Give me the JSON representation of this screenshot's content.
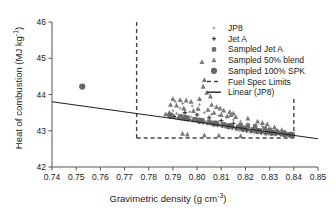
{
  "chart_data": {
    "type": "scatter",
    "title": "",
    "xlabel": "Gravimetric density (g cm",
    "xlabel_sup": "-3",
    "xlabel_tail": ")",
    "ylabel": "Heat of combustion (MJ kg",
    "ylabel_sup": "-1",
    "ylabel_tail": ")",
    "xlim": [
      0.74,
      0.85
    ],
    "ylim": [
      42,
      46
    ],
    "xticks": [
      "0.74",
      "0.75",
      "0.76",
      "0.77",
      "0.78",
      "0.79",
      "0.80",
      "0.81",
      "0.82",
      "0.83",
      "0.84",
      "0.85"
    ],
    "xtick_values": [
      0.74,
      0.75,
      0.76,
      0.77,
      0.78,
      0.79,
      0.8,
      0.81,
      0.82,
      0.83,
      0.84,
      0.85
    ],
    "yticks": [
      "42",
      "43",
      "44",
      "45",
      "46"
    ],
    "ytick_values": [
      42,
      43,
      44,
      45,
      46
    ],
    "grid": false,
    "legend_position": "top-right",
    "colors": {
      "jp8": "#8c8c8c",
      "jet_a": "#3c3c3c",
      "sampled_jet_a": "#6e6e6e",
      "sampled_50_blend": "#7a7a7a",
      "sampled_100_spk": "#666666",
      "spec_limits": "#444444",
      "linear_fit": "#222222",
      "axis": "#555555",
      "text": "#1a1a1a"
    },
    "legend": [
      {
        "label": "JP8",
        "marker": "plus-small",
        "color": "#8c8c8c"
      },
      {
        "label": "Jet A",
        "marker": "plus",
        "color": "#3c3c3c"
      },
      {
        "label": "Sampled Jet A",
        "marker": "square",
        "color": "#6e6e6e"
      },
      {
        "label": "Sampled 50% blend",
        "marker": "triangle",
        "color": "#7a7a7a"
      },
      {
        "label": "Sampled 100% SPK",
        "marker": "circle",
        "color": "#666666"
      },
      {
        "label": "Fuel Spec Limits",
        "marker": "dashed-line",
        "color": "#444444"
      },
      {
        "label": "Linear (JP8)",
        "marker": "solid-line",
        "color": "#222222"
      }
    ],
    "annotations": [
      {
        "name": "fuel-spec-lower-density",
        "type": "vline",
        "x": 0.775,
        "y_from": 42.8,
        "y_to": 46.0,
        "style": "dashed"
      },
      {
        "name": "fuel-spec-upper-density",
        "type": "vline",
        "x": 0.84,
        "y_from": 42.8,
        "y_to": 43.95,
        "style": "dashed"
      },
      {
        "name": "fuel-spec-min-heat",
        "type": "hline",
        "y": 42.8,
        "x_from": 0.775,
        "x_to": 0.84,
        "style": "dashed"
      }
    ],
    "fit_line": {
      "name": "Linear (JP8)",
      "x_from": 0.74,
      "y_from": 43.8,
      "x_to": 0.85,
      "y_to": 42.78,
      "slope": -9.27,
      "intercept": 50.66
    },
    "series": [
      {
        "name": "JP8",
        "marker": "plus-small",
        "color": "#8c8c8c",
        "points": [
          [
            0.788,
            43.44
          ],
          [
            0.789,
            43.4
          ],
          [
            0.7895,
            43.46
          ],
          [
            0.79,
            43.38
          ],
          [
            0.7905,
            43.42
          ],
          [
            0.791,
            43.35
          ],
          [
            0.7915,
            43.48
          ],
          [
            0.792,
            43.33
          ],
          [
            0.7925,
            43.41
          ],
          [
            0.793,
            43.37
          ],
          [
            0.7935,
            43.3
          ],
          [
            0.794,
            43.44
          ],
          [
            0.7945,
            43.36
          ],
          [
            0.795,
            43.32
          ],
          [
            0.7955,
            43.39
          ],
          [
            0.796,
            43.28
          ],
          [
            0.7965,
            43.35
          ],
          [
            0.797,
            43.31
          ],
          [
            0.7975,
            43.38
          ],
          [
            0.798,
            43.27
          ],
          [
            0.7985,
            43.34
          ],
          [
            0.799,
            43.3
          ],
          [
            0.7995,
            43.25
          ],
          [
            0.8,
            43.33
          ],
          [
            0.8005,
            43.28
          ],
          [
            0.801,
            43.23
          ],
          [
            0.8015,
            43.31
          ],
          [
            0.802,
            43.26
          ],
          [
            0.8025,
            43.21
          ],
          [
            0.803,
            43.29
          ],
          [
            0.8035,
            43.24
          ],
          [
            0.804,
            43.19
          ],
          [
            0.8045,
            43.27
          ],
          [
            0.805,
            43.22
          ],
          [
            0.8055,
            43.17
          ],
          [
            0.806,
            43.25
          ],
          [
            0.8065,
            43.2
          ],
          [
            0.807,
            43.15
          ],
          [
            0.8075,
            43.23
          ],
          [
            0.808,
            43.18
          ],
          [
            0.8085,
            43.13
          ],
          [
            0.809,
            43.21
          ],
          [
            0.8095,
            43.16
          ],
          [
            0.81,
            43.11
          ],
          [
            0.8105,
            43.19
          ],
          [
            0.811,
            43.14
          ],
          [
            0.8115,
            43.09
          ],
          [
            0.812,
            43.17
          ],
          [
            0.8125,
            43.12
          ],
          [
            0.813,
            43.07
          ],
          [
            0.8135,
            43.15
          ],
          [
            0.814,
            43.1
          ],
          [
            0.8145,
            43.05
          ],
          [
            0.815,
            43.13
          ],
          [
            0.8155,
            43.08
          ],
          [
            0.816,
            43.03
          ],
          [
            0.8165,
            43.11
          ],
          [
            0.817,
            43.06
          ],
          [
            0.8175,
            43.01
          ],
          [
            0.818,
            43.09
          ],
          [
            0.8185,
            43.04
          ],
          [
            0.819,
            42.99
          ],
          [
            0.8195,
            43.07
          ],
          [
            0.82,
            43.02
          ],
          [
            0.8205,
            42.97
          ],
          [
            0.821,
            43.05
          ],
          [
            0.8215,
            43.0
          ],
          [
            0.822,
            42.96
          ],
          [
            0.8225,
            43.03
          ],
          [
            0.823,
            42.98
          ],
          [
            0.8235,
            42.94
          ],
          [
            0.824,
            43.01
          ],
          [
            0.8245,
            42.97
          ],
          [
            0.825,
            42.93
          ],
          [
            0.8255,
            43.0
          ],
          [
            0.826,
            42.96
          ],
          [
            0.8265,
            42.92
          ],
          [
            0.827,
            42.99
          ],
          [
            0.8275,
            42.95
          ],
          [
            0.828,
            42.91
          ],
          [
            0.8285,
            42.98
          ],
          [
            0.829,
            42.94
          ],
          [
            0.8295,
            42.9
          ],
          [
            0.83,
            42.97
          ],
          [
            0.8305,
            42.93
          ],
          [
            0.831,
            42.89
          ],
          [
            0.8315,
            42.96
          ],
          [
            0.832,
            42.92
          ],
          [
            0.8325,
            42.88
          ],
          [
            0.833,
            42.95
          ],
          [
            0.8335,
            42.91
          ],
          [
            0.834,
            42.94
          ],
          [
            0.8345,
            42.9
          ],
          [
            0.835,
            42.93
          ],
          [
            0.8355,
            42.89
          ],
          [
            0.836,
            42.92
          ],
          [
            0.8365,
            42.88
          ],
          [
            0.837,
            42.91
          ],
          [
            0.8375,
            42.9
          ],
          [
            0.838,
            42.89
          ],
          [
            0.79,
            43.55
          ],
          [
            0.793,
            43.62
          ],
          [
            0.795,
            43.58
          ],
          [
            0.797,
            43.52
          ],
          [
            0.8,
            43.6
          ],
          [
            0.803,
            43.5
          ],
          [
            0.806,
            43.45
          ],
          [
            0.809,
            43.42
          ],
          [
            0.812,
            43.38
          ],
          [
            0.815,
            43.3
          ],
          [
            0.818,
            43.26
          ],
          [
            0.821,
            43.2
          ],
          [
            0.824,
            43.16
          ],
          [
            0.827,
            43.12
          ],
          [
            0.83,
            43.08
          ],
          [
            0.833,
            43.04
          ],
          [
            0.836,
            43.0
          ],
          [
            0.83,
            43.0
          ],
          [
            0.832,
            42.99
          ],
          [
            0.834,
            42.98
          ],
          [
            0.789,
            43.7
          ],
          [
            0.791,
            43.8
          ],
          [
            0.794,
            43.75
          ],
          [
            0.798,
            43.68
          ],
          [
            0.801,
            43.72
          ]
        ]
      },
      {
        "name": "Jet A",
        "marker": "plus",
        "color": "#3c3c3c",
        "points": [
          [
            0.7885,
            43.43
          ],
          [
            0.7905,
            43.39
          ],
          [
            0.7925,
            43.36
          ],
          [
            0.7945,
            43.34
          ],
          [
            0.7965,
            43.31
          ],
          [
            0.7985,
            43.29
          ],
          [
            0.8005,
            43.26
          ],
          [
            0.8025,
            43.24
          ],
          [
            0.8045,
            43.21
          ],
          [
            0.8065,
            43.19
          ],
          [
            0.8085,
            43.16
          ],
          [
            0.8105,
            43.14
          ],
          [
            0.8125,
            43.11
          ],
          [
            0.8145,
            43.09
          ],
          [
            0.8165,
            43.06
          ],
          [
            0.8185,
            43.04
          ],
          [
            0.8205,
            43.01
          ],
          [
            0.8225,
            42.99
          ],
          [
            0.8245,
            42.97
          ],
          [
            0.8265,
            42.95
          ],
          [
            0.8285,
            42.93
          ],
          [
            0.8305,
            42.92
          ],
          [
            0.8325,
            42.91
          ],
          [
            0.8345,
            42.9
          ],
          [
            0.8365,
            42.89
          ],
          [
            0.795,
            43.5
          ],
          [
            0.8,
            43.44
          ],
          [
            0.805,
            43.36
          ],
          [
            0.81,
            43.28
          ],
          [
            0.815,
            43.2
          ]
        ]
      },
      {
        "name": "Sampled Jet A",
        "marker": "square",
        "color": "#6e6e6e",
        "points": [
          [
            0.793,
            43.4
          ],
          [
            0.796,
            43.36
          ],
          [
            0.799,
            43.32
          ],
          [
            0.802,
            43.29
          ],
          [
            0.805,
            43.25
          ],
          [
            0.808,
            43.22
          ],
          [
            0.811,
            43.18
          ],
          [
            0.814,
            43.15
          ],
          [
            0.817,
            43.11
          ],
          [
            0.82,
            43.08
          ],
          [
            0.823,
            43.04
          ],
          [
            0.826,
            43.01
          ],
          [
            0.829,
            42.98
          ],
          [
            0.832,
            42.95
          ],
          [
            0.835,
            42.92
          ],
          [
            0.8375,
            42.9
          ],
          [
            0.8395,
            42.89
          ],
          [
            0.824,
            43.12
          ],
          [
            0.828,
            43.06
          ],
          [
            0.83,
            43.02
          ],
          [
            0.818,
            43.16
          ],
          [
            0.821,
            43.13
          ],
          [
            0.833,
            42.97
          ],
          [
            0.836,
            42.94
          ],
          [
            0.839,
            42.91
          ]
        ]
      },
      {
        "name": "Sampled 50% blend",
        "marker": "triangle",
        "color": "#7a7a7a",
        "points": [
          [
            0.802,
            44.9
          ],
          [
            0.803,
            44.4
          ],
          [
            0.8025,
            44.22
          ],
          [
            0.804,
            44.05
          ],
          [
            0.8055,
            43.95
          ],
          [
            0.801,
            43.88
          ],
          [
            0.79,
            43.88
          ],
          [
            0.793,
            43.85
          ],
          [
            0.7955,
            43.84
          ],
          [
            0.7975,
            43.8
          ],
          [
            0.806,
            43.72
          ],
          [
            0.808,
            43.66
          ],
          [
            0.8095,
            43.62
          ],
          [
            0.811,
            43.56
          ],
          [
            0.8045,
            43.58
          ],
          [
            0.7985,
            43.55
          ],
          [
            0.8005,
            43.6
          ],
          [
            0.8135,
            43.52
          ],
          [
            0.815,
            43.48
          ],
          [
            0.7945,
            43.62
          ],
          [
            0.7915,
            43.7
          ],
          [
            0.789,
            43.72
          ],
          [
            0.807,
            43.5
          ],
          [
            0.81,
            43.44
          ],
          [
            0.8125,
            43.4
          ],
          [
            0.794,
            42.92
          ],
          [
            0.796,
            42.9
          ],
          [
            0.803,
            42.88
          ],
          [
            0.809,
            42.87
          ],
          [
            0.818,
            42.86
          ],
          [
            0.821,
            43.34
          ],
          [
            0.825,
            43.26
          ],
          [
            0.829,
            43.18
          ],
          [
            0.832,
            43.1
          ],
          [
            0.835,
            43.02
          ],
          [
            0.816,
            43.38
          ],
          [
            0.814,
            43.44
          ],
          [
            0.787,
            43.46
          ],
          [
            0.7885,
            43.5
          ],
          [
            0.827,
            43.22
          ]
        ]
      },
      {
        "name": "Sampled 100% SPK",
        "marker": "circle",
        "color": "#666666",
        "points": [
          [
            0.7525,
            44.22
          ],
          [
            0.789,
            43.42
          ],
          [
            0.795,
            43.35
          ],
          [
            0.801,
            43.28
          ],
          [
            0.807,
            43.2
          ],
          [
            0.813,
            43.13
          ],
          [
            0.819,
            43.06
          ],
          [
            0.825,
            43.0
          ],
          [
            0.831,
            42.95
          ],
          [
            0.836,
            42.91
          ],
          [
            0.8385,
            42.89
          ]
        ]
      }
    ]
  }
}
